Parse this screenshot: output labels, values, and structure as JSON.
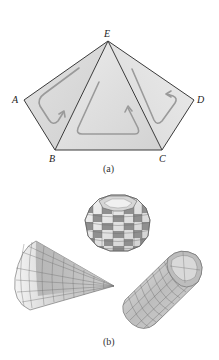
{
  "figure": {
    "panel_a": {
      "caption": "(a)",
      "vertices": {
        "A": {
          "label": "A",
          "x": 24,
          "y": 100
        },
        "B": {
          "label": "B",
          "x": 55,
          "y": 150
        },
        "C": {
          "label": "C",
          "x": 162,
          "y": 150
        },
        "D": {
          "label": "D",
          "x": 194,
          "y": 100
        },
        "E": {
          "label": "E",
          "x": 108,
          "y": 41
        }
      },
      "faces": [
        {
          "name": "triangle-ABE",
          "color": "#dcdcdc"
        },
        {
          "name": "triangle-BCE",
          "color": "#e4e4e4"
        },
        {
          "name": "triangle-CDE",
          "color": "#dedede"
        }
      ],
      "loop_color": "#9a9a9a",
      "edge_color": "#3a3a3a"
    },
    "panel_b": {
      "caption": "(b)",
      "shapes": [
        {
          "name": "sphere-polyhedron",
          "light": "#f2f2f2",
          "dark": "#8c8c8c"
        },
        {
          "name": "cone-mesh",
          "light": "#ececec",
          "dark": "#a8a8a8"
        },
        {
          "name": "cylinder-mesh",
          "light": "#e8e8e8",
          "dark": "#9a9a9a"
        }
      ]
    }
  }
}
